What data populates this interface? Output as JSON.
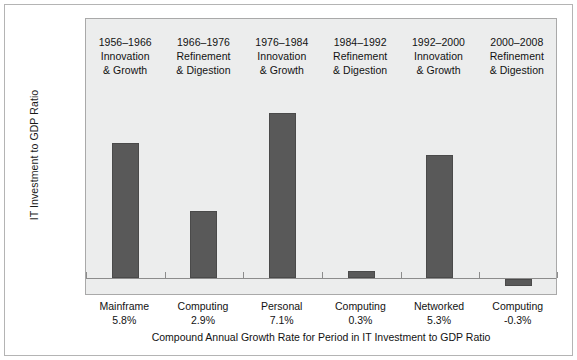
{
  "chart_data": {
    "type": "bar",
    "title": "",
    "subtitle": "",
    "xlabel": "Compound Annual Growth Rate for Period in IT Investment to GDP Ratio",
    "ylabel": "IT Investment to GDP Ratio",
    "grid": false,
    "legend": "none",
    "ylim": [
      -0.3,
      7.1
    ],
    "categories": [
      "Mainframe",
      "Computing",
      "Personal",
      "Computing",
      "Networked",
      "Computing"
    ],
    "value_labels": [
      "5.8%",
      "2.9%",
      "7.1%",
      "0.3%",
      "5.3%",
      "-0.3%"
    ],
    "values": [
      5.8,
      2.9,
      7.1,
      0.3,
      5.3,
      -0.3
    ],
    "period_labels": [
      {
        "years": "1956–1966",
        "line1": "Innovation",
        "line2": "& Growth"
      },
      {
        "years": "1966–1976",
        "line1": "Refinement",
        "line2": "& Digestion"
      },
      {
        "years": "1976–1984",
        "line1": "Innovation",
        "line2": "& Growth"
      },
      {
        "years": "1984–1992",
        "line1": "Refinement",
        "line2": "& Digestion"
      },
      {
        "years": "1992–2000",
        "line1": "Innovation",
        "line2": "& Growth"
      },
      {
        "years": "2000–2008",
        "line1": "Refinement",
        "line2": "& Digestion"
      }
    ],
    "colors": {
      "bar": "#595959",
      "bar_border": "#4a4a4a",
      "panel_background": "#eceded",
      "panel_border": "#a9a9a9",
      "axis_line": "#8c8c8c",
      "frame_border": "#b4b4b4",
      "text": "#121212",
      "figure_background": "#ffffff"
    }
  }
}
